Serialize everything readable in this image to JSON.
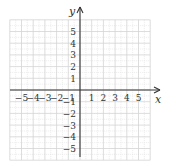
{
  "chart_data": {
    "type": "scatter",
    "title": "",
    "xlabel": "x",
    "ylabel": "y",
    "xlim": [
      -6,
      6
    ],
    "ylim": [
      -6,
      6
    ],
    "grid": true,
    "x_ticks": [
      "-5",
      "-4",
      "-3",
      "-2",
      "-1",
      "1",
      "2",
      "3",
      "4",
      "5"
    ],
    "y_ticks": [
      "5",
      "4",
      "3",
      "2",
      "1",
      "-1",
      "-2",
      "-3",
      "-4",
      "-5"
    ],
    "points": []
  },
  "axes": {
    "x_label": "x",
    "y_label": "y"
  },
  "colors": {
    "grid": "#d4d4d4",
    "subgrid": "#e6e6e6",
    "axis": "#333333",
    "text": "#333333"
  }
}
